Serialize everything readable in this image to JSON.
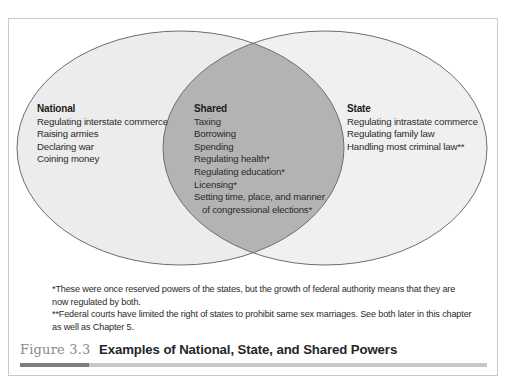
{
  "diagram": {
    "type": "venn",
    "colors": {
      "circle_fill": "#ececec",
      "overlap_fill": "#b3b3b3",
      "circle_stroke": "#6e6e6e",
      "frame_border": "#c9c9c9",
      "caption_label": "#8a8a8a",
      "rule_dark": "#7d7d7d",
      "rule_light": "#c7c7c7"
    },
    "sets": [
      {
        "id": "national",
        "heading": "National",
        "items": [
          "Regulating interstate commerce",
          "Raising armies",
          "Declaring war",
          "Coining money"
        ]
      },
      {
        "id": "shared",
        "heading": "Shared",
        "items": [
          "Taxing",
          "Borrowing",
          "Spending",
          "Regulating health*",
          "Regulating education*",
          "Licensing*",
          "Setting time, place, and manner",
          "of congressional elections*"
        ]
      },
      {
        "id": "state",
        "heading": "State",
        "items": [
          "Regulating intrastate commerce",
          "Regulating family law",
          "Handling most criminal law**"
        ]
      }
    ]
  },
  "notes": [
    "*These were once reserved powers of the states, but the growth of federal authority means that they are now regulated by both.",
    "**Federal courts have limited the right of states to prohibit same sex marriages. See both later in this chapter as well as Chapter 5."
  ],
  "caption": {
    "label": "Figure 3.3",
    "title": "Examples of National, State, and Shared Powers"
  }
}
